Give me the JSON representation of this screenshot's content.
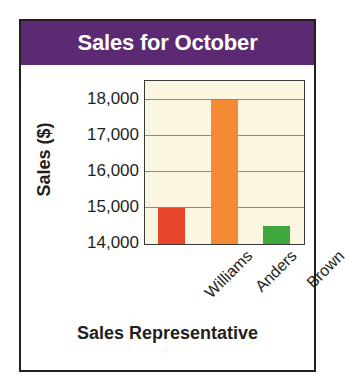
{
  "chart_data": {
    "type": "bar",
    "title": "Sales for October",
    "xlabel": "Sales Representative",
    "ylabel": "Sales ($)",
    "categories": [
      "Williams",
      "Anders",
      "Brown"
    ],
    "values": [
      15000,
      18000,
      14500
    ],
    "series": [
      {
        "name": "October Sales",
        "values": [
          15000,
          18000,
          14500
        ]
      }
    ],
    "bar_colors": [
      "#e8452a",
      "#f58a35",
      "#3fa83c"
    ],
    "ylim": [
      14000,
      18500
    ],
    "yticks": [
      14000,
      15000,
      16000,
      17000,
      18000
    ],
    "ytick_labels": [
      "14,000",
      "15,000",
      "16,000",
      "17,000",
      "18,000"
    ],
    "grid": true,
    "legend": "none",
    "plot_background": "#faf6e2",
    "title_background": "#5b2a72",
    "title_color": "#ffffff",
    "axis_color": "#231f20"
  }
}
